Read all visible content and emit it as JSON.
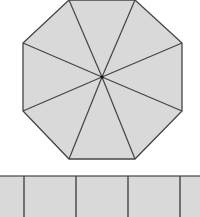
{
  "diagram": {
    "colors": {
      "fill": "#d9d9d9",
      "stroke": "#444444",
      "background": "#ffffff"
    },
    "octagon": {
      "center": [
        102,
        77
      ],
      "vertices": [
        [
          69,
          0
        ],
        [
          135,
          0
        ],
        [
          182,
          43
        ],
        [
          182,
          111
        ],
        [
          135,
          159
        ],
        [
          69,
          159
        ],
        [
          23,
          111
        ],
        [
          23,
          43
        ]
      ],
      "segments": 8
    },
    "strip": {
      "top": 176,
      "bottom": 217,
      "dividers": [
        24,
        76,
        128,
        180
      ],
      "cells": 5
    }
  }
}
